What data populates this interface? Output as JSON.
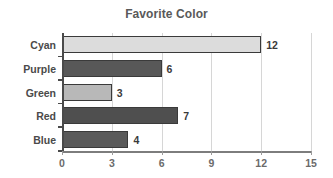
{
  "chart_data": {
    "type": "bar",
    "orientation": "horizontal",
    "title": "Favorite Color",
    "xlabel": "",
    "ylabel": "",
    "categories": [
      "Cyan",
      "Purple",
      "Green",
      "Red",
      "Blue"
    ],
    "values": [
      12,
      6,
      3,
      7,
      4
    ],
    "value_labels": [
      "12",
      "6",
      "3",
      "7",
      "4"
    ],
    "bar_colors": [
      "#dcdcdc",
      "#585858",
      "#b8b8b8",
      "#4f4f4f",
      "#5a5a5a"
    ],
    "bar_edge_color": "#3a3a3a",
    "xlim": [
      0,
      15
    ],
    "xticks": [
      0,
      3,
      6,
      9,
      12,
      15
    ],
    "xtick_labels": [
      "0",
      "3",
      "6",
      "9",
      "12",
      "15"
    ],
    "grid": "vertical",
    "legend": "none",
    "title_color": "#595959",
    "axis_color": "#4a4a4a",
    "grid_color": "#d6d6d6",
    "background": "#ffffff"
  }
}
